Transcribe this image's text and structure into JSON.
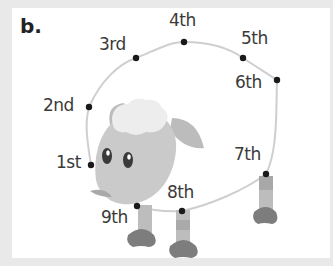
{
  "figure": {
    "panel_label": "b.",
    "colors": {
      "background": "#e9e9e9",
      "panel": "#ffffff",
      "outline_path": "#c8c8c8",
      "dot": "#1a1a1a",
      "sheep_body": "#c9c9c9",
      "sheep_wool": "#ececec",
      "sheep_hoof": "#7d7d7d",
      "sheep_leg": "#b5b5b5"
    },
    "points": [
      {
        "label": "1st",
        "x": 91,
        "y": 165
      },
      {
        "label": "2nd",
        "x": 89,
        "y": 107
      },
      {
        "label": "3rd",
        "x": 136,
        "y": 58
      },
      {
        "label": "4th",
        "x": 184,
        "y": 42
      },
      {
        "label": "5th",
        "x": 243,
        "y": 58
      },
      {
        "label": "6th",
        "x": 277,
        "y": 80
      },
      {
        "label": "7th",
        "x": 266,
        "y": 174
      },
      {
        "label": "8th",
        "x": 182,
        "y": 211
      },
      {
        "label": "9th",
        "x": 137,
        "y": 206
      }
    ]
  }
}
